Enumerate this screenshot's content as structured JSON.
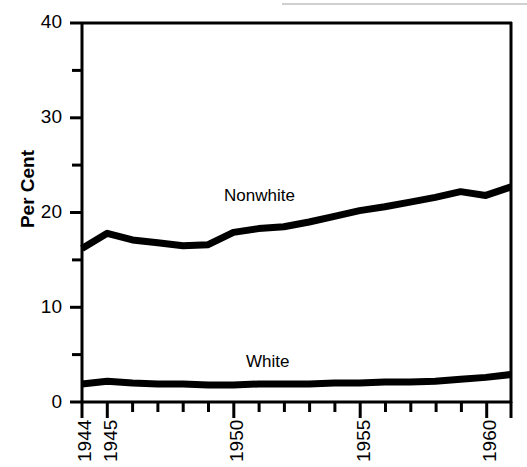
{
  "figure": {
    "background_color": "#ffffff",
    "ink_color": "#000000"
  },
  "axis": {
    "ylabel": "Per Cent",
    "y_ticks_major": [
      "0",
      "10",
      "20",
      "30",
      "40"
    ],
    "y_ticks_minor": [
      "5",
      "15",
      "25",
      "35"
    ],
    "x_tick_labels": [
      "1944",
      "1945",
      "1950",
      "1955",
      "1960"
    ]
  },
  "series_labels": {
    "nonwhite": "Nonwhite",
    "white": "White"
  },
  "chart_data": {
    "type": "line",
    "title": "",
    "xlabel": "",
    "ylabel": "Per Cent",
    "xlim": [
      1944,
      1961
    ],
    "ylim": [
      0,
      40
    ],
    "grid": false,
    "legend": "inline-annotation",
    "x": [
      1944,
      1945,
      1946,
      1947,
      1948,
      1949,
      1950,
      1951,
      1952,
      1953,
      1954,
      1955,
      1956,
      1957,
      1958,
      1959,
      1960,
      1961
    ],
    "series": [
      {
        "name": "Nonwhite",
        "color": "#000000",
        "values": [
          16.2,
          17.8,
          17.1,
          16.8,
          16.5,
          16.6,
          17.9,
          18.3,
          18.5,
          19.0,
          19.6,
          20.2,
          20.6,
          21.1,
          21.6,
          22.2,
          21.8,
          22.7
        ]
      },
      {
        "name": "White",
        "color": "#000000",
        "values": [
          1.9,
          2.2,
          2.0,
          1.9,
          1.9,
          1.8,
          1.8,
          1.9,
          1.9,
          1.9,
          2.0,
          2.0,
          2.1,
          2.1,
          2.2,
          2.4,
          2.6,
          2.9
        ]
      }
    ],
    "annotations": [
      {
        "text": "Nonwhite",
        "x": 1951.5,
        "y": 21.8
      },
      {
        "text": "White",
        "x": 1952.5,
        "y": 5.2
      }
    ]
  }
}
